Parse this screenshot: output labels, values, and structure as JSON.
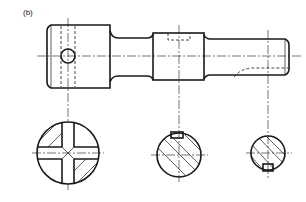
{
  "figure": {
    "label": "(b)",
    "type": "engineering-drawing"
  },
  "views": {
    "elevation": {
      "name": "shaft-elevation"
    },
    "sections": [
      {
        "name": "section-head-cross-holes"
      },
      {
        "name": "section-collar-keyway-top"
      },
      {
        "name": "section-shaft-keyway-bottom"
      }
    ]
  }
}
